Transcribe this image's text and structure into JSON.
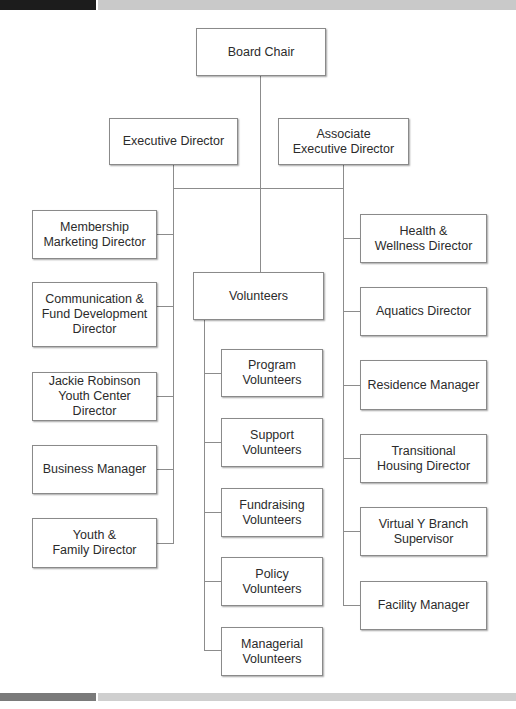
{
  "chart": {
    "root": "Board Chair",
    "executive_level": [
      "Executive Director",
      "Associate\nExecutive Director"
    ],
    "left_column": [
      "Membership\nMarketing Director",
      "Communication &\nFund Development\nDirector",
      "Jackie Robinson\nYouth Center Director",
      "Business Manager",
      "Youth &\nFamily Director"
    ],
    "center": {
      "head": "Volunteers",
      "children": [
        "Program\nVolunteers",
        "Support\nVolunteers",
        "Fundraising\nVolunteers",
        "Policy\nVolunteers",
        "Managerial\nVolunteers"
      ]
    },
    "right_column": [
      "Health &\nWellness Director",
      "Aquatics Director",
      "Residence Manager",
      "Transitional\nHousing Director",
      "Virtual Y Branch\nSupervisor",
      "Facility Manager"
    ]
  },
  "colors": {
    "band_dark": "#1c1c1c",
    "band_light": "#c9c9c9",
    "footer_dark": "#7a7a7a",
    "footer_light": "#cfcfcf",
    "connector": "#8c8c8c",
    "box_border": "#8a8a8a"
  }
}
